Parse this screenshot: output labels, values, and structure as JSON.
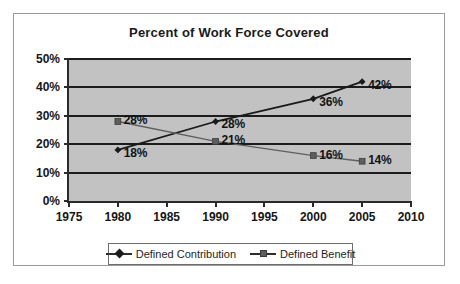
{
  "chart_data": {
    "type": "line",
    "title": "Percent of Work Force Covered",
    "xlabel": "",
    "ylabel": "",
    "x": [
      1980,
      1990,
      2000,
      2005
    ],
    "xlim": [
      1975,
      2010
    ],
    "ylim": [
      0,
      50
    ],
    "ytick_labels": [
      "0%",
      "10%",
      "20%",
      "30%",
      "40%",
      "50%"
    ],
    "ytick_values": [
      0,
      10,
      20,
      30,
      40,
      50
    ],
    "xtick_labels": [
      "1975",
      "1980",
      "1985",
      "1990",
      "1995",
      "2000",
      "2005",
      "2010"
    ],
    "xtick_values": [
      1975,
      1980,
      1985,
      1990,
      1995,
      2000,
      2005,
      2010
    ],
    "grid": true,
    "legend_position": "bottom",
    "plot_background": "#c2c2c2",
    "series": [
      {
        "name": "Defined Contribution",
        "marker": "diamond",
        "color": "#1a1a1a",
        "values": [
          18,
          28,
          36,
          42
        ],
        "data_labels": [
          "18%",
          "28%",
          "36%",
          "42%"
        ]
      },
      {
        "name": "Defined Benefit",
        "marker": "square",
        "color": "#5e5e5e",
        "values": [
          28,
          21,
          16,
          14
        ],
        "data_labels": [
          "28%",
          "21%",
          "16%",
          "14%"
        ]
      }
    ]
  },
  "legend": {
    "items": [
      {
        "label": "Defined Contribution"
      },
      {
        "label": "Defined Benefit"
      }
    ]
  }
}
